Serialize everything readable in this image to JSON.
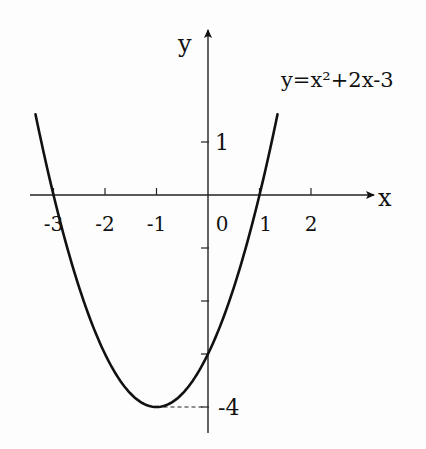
{
  "chart_data": {
    "type": "line",
    "title": "",
    "equation_label": "y=x²+2x-3",
    "xlabel": "x",
    "ylabel": "y",
    "x_ticks": [
      -3,
      -2,
      -1,
      0,
      1,
      2
    ],
    "x_tick_labels": [
      "-3",
      "-2",
      "-1",
      "0",
      "1",
      "2"
    ],
    "y_ticks": [
      1,
      -1,
      -2,
      -3,
      -4
    ],
    "y_tick_labels": [
      "1",
      "",
      "",
      "",
      "-4"
    ],
    "xlim": [
      -3.4,
      3.2
    ],
    "ylim": [
      -4.5,
      3.1
    ],
    "grid": false,
    "series": [
      {
        "name": "y=x^2+2x-3",
        "function": "x^2+2x-3",
        "x_range": [
          -3.35,
          1.35
        ],
        "x": [
          -3.35,
          -3,
          -2.5,
          -2,
          -1.5,
          -1,
          -0.5,
          0,
          0.5,
          1,
          1.35
        ],
        "values": [
          1.52,
          0,
          -1.75,
          -3,
          -3.75,
          -4,
          -3.75,
          -3,
          -1.75,
          0,
          1.52
        ]
      }
    ],
    "annotations": [
      {
        "type": "dashed-line",
        "from": [
          -1,
          -4
        ],
        "to": [
          0,
          -4
        ],
        "label": "-4"
      },
      {
        "type": "point",
        "label": "vertex",
        "x": -1,
        "y": -4
      }
    ]
  }
}
